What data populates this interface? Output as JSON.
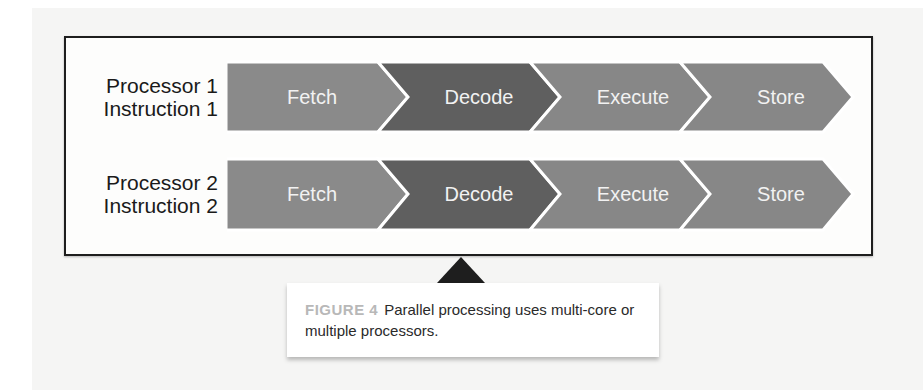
{
  "figure": {
    "rows": [
      {
        "label_line1": "Processor 1",
        "label_line2": "Instruction 1",
        "stages": [
          "Fetch",
          "Decode",
          "Execute",
          "Store"
        ]
      },
      {
        "label_line1": "Processor 2",
        "label_line2": "Instruction 2",
        "stages": [
          "Fetch",
          "Decode",
          "Execute",
          "Store"
        ]
      }
    ],
    "colors": {
      "stage_light": "#8a8a8a",
      "stage_dark": "#5f5f5f",
      "stage_text": "#f2f2f2",
      "frame_border": "#1e1e1e"
    }
  },
  "caption": {
    "figure_label": "FIGURE 4",
    "text": "Parallel processing uses multi-core or multiple processors."
  }
}
